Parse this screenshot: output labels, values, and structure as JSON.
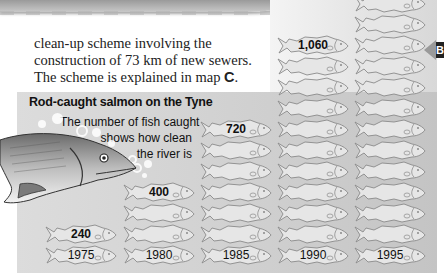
{
  "page": {
    "body_text": {
      "line1": "clean-up scheme involving the",
      "line2": "construction of 73 km of new sewers.",
      "line3_prefix": "The scheme is explained in map ",
      "line3_bold": "C",
      "line3_suffix": "."
    },
    "side_marker": "B"
  },
  "chart_data": {
    "type": "bar",
    "style": "pictogram",
    "title": "Rod-caught salmon on the Tyne",
    "subtitle": [
      "The number of fish caught",
      "shows how clean",
      "the river is"
    ],
    "categories": [
      "1975",
      "1980",
      "1985",
      "1990",
      "1995"
    ],
    "values": [
      240,
      400,
      720,
      1060,
      null
    ],
    "value_labels": [
      "240",
      "400",
      "720",
      "1,060",
      ""
    ],
    "fish_icons": [
      2,
      4,
      7,
      11,
      13
    ],
    "note": "1995 column extends beyond the visible top edge; its value label is not visible",
    "xlabel": "",
    "ylabel": "",
    "grid": false,
    "colors": {
      "fish_fill": "#e6e6e6",
      "fish_outline": "#8a8a8a",
      "panel": "#d2d2d2"
    }
  }
}
